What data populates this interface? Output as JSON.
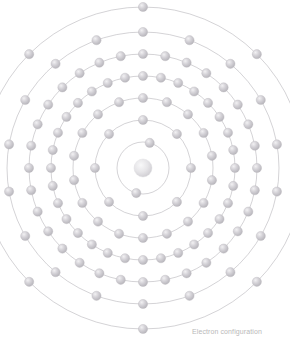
{
  "diagram": {
    "nucleus": {
      "label": "",
      "color": "#d8d8d8",
      "radius": 9
    },
    "shell_stroke_color": "#b0aeb4",
    "electron_color": "#c9c7cc",
    "electron_radius": 4.6,
    "center": {
      "x": 143,
      "y": 168
    },
    "shells": [
      {
        "index": 1,
        "name": "K",
        "radius": 26,
        "electrons": 2,
        "phase_deg": -75
      },
      {
        "index": 2,
        "name": "L",
        "radius": 48,
        "electrons": 8,
        "phase_deg": -90
      },
      {
        "index": 3,
        "name": "M",
        "radius": 70,
        "electrons": 18,
        "phase_deg": -90
      },
      {
        "index": 4,
        "name": "N",
        "radius": 92,
        "electrons": 32,
        "phase_deg": -90
      },
      {
        "index": 5,
        "name": "O",
        "radius": 114,
        "electrons": 32,
        "phase_deg": -90
      },
      {
        "index": 6,
        "name": "P",
        "radius": 136,
        "electrons": 18,
        "phase_deg": -90
      },
      {
        "index": 7,
        "name": "Q",
        "radius": 161,
        "electrons": 8,
        "phase_deg": -90
      }
    ]
  },
  "chart_data": {
    "type": "scatter",
    "xlabel": "",
    "ylabel": "",
    "categories": [
      "K",
      "L",
      "M",
      "N",
      "O",
      "P",
      "Q"
    ],
    "values": [
      2,
      8,
      18,
      32,
      32,
      18,
      8
    ],
    "series": [
      {
        "name": "Electrons per shell",
        "values": [
          2,
          8,
          18,
          32,
          32,
          18,
          8
        ]
      },
      {
        "name": "Shell radius (px)",
        "values": [
          26,
          48,
          70,
          92,
          114,
          136,
          161
        ]
      }
    ],
    "annotations": [
      "Electron configuration"
    ],
    "legend_position": "none",
    "grid": false
  },
  "captions": {
    "electron_configuration": "Electron configuration"
  }
}
